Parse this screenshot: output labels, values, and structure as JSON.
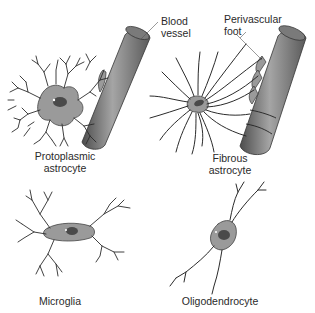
{
  "figure": {
    "panels": [
      {
        "id": "protoplasmic",
        "label_line1": "Protoplasmic",
        "label_line2": "astrocyte"
      },
      {
        "id": "fibrous",
        "label_line1": "Fibrous",
        "label_line2": "astrocyte"
      },
      {
        "id": "microglia",
        "label_line1": "Microglia"
      },
      {
        "id": "oligodendrocyte",
        "label_line1": "Oligodendrocyte"
      }
    ],
    "annotations": {
      "blood_vessel_line1": "Blood",
      "blood_vessel_line2": "vessel",
      "perivascular_line1": "Perivascular",
      "perivascular_line2": "foot"
    },
    "colors": {
      "background": "#ffffff",
      "cell_body": "#9a9a9a",
      "nucleus": "#4a4a4a",
      "process_stroke": "#2b2b2b",
      "vessel_dark": "#555555",
      "vessel_light": "#9c9c9c",
      "text": "#2a2a2a"
    }
  }
}
